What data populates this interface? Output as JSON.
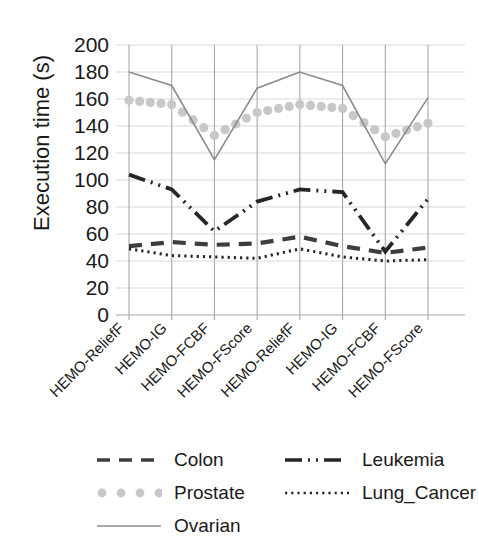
{
  "chart_data": {
    "type": "line",
    "title": "",
    "xlabel": "",
    "ylabel": "Execution time (s)",
    "ylim": [
      0,
      200
    ],
    "ytick_step": 20,
    "yticks": [
      "0",
      "20",
      "40",
      "60",
      "80",
      "100",
      "120",
      "140",
      "160",
      "180",
      "200"
    ],
    "grid": true,
    "legend_position": "bottom",
    "categories": [
      "HEMO-ReliefF",
      "HEMO-IG",
      "HEMO-FCBF",
      "HEMO-FScore",
      "HEMO-ReliefF",
      "HEMO-IG",
      "HEMO-FCBF",
      "HEMO-FScore"
    ],
    "series": [
      {
        "name": "Colon",
        "style": "dashed",
        "color": "#3d3d3d",
        "values": [
          51,
          54,
          52,
          53,
          58,
          51,
          46,
          50
        ]
      },
      {
        "name": "Prostate",
        "style": "dotted-round",
        "color": "#c8c8c8",
        "values": [
          159,
          156,
          133,
          150,
          156,
          153,
          132,
          142
        ]
      },
      {
        "name": "Ovarian",
        "style": "solid",
        "color": "#8c8c8c",
        "values": [
          180,
          170,
          115,
          168,
          180,
          170,
          112,
          161
        ]
      },
      {
        "name": "Leukemia",
        "style": "dash-dot",
        "color": "#262626",
        "values": [
          104,
          93,
          62,
          84,
          93,
          91,
          47,
          86
        ]
      },
      {
        "name": "Lung_Cancer",
        "style": "fine-dotted",
        "color": "#262626",
        "values": [
          49,
          44,
          43,
          42,
          49,
          43,
          40,
          41
        ]
      }
    ]
  },
  "legend": {
    "entries": [
      {
        "label": "Colon",
        "marker": "dashed-line-swatch"
      },
      {
        "label": "Prostate",
        "marker": "dotted-circles-swatch"
      },
      {
        "label": "Ovarian",
        "marker": "solid-line-swatch"
      },
      {
        "label": "Leukemia",
        "marker": "dash-dot-line-swatch"
      },
      {
        "label": "Lung_Cancer",
        "marker": "fine-dotted-line-swatch"
      }
    ]
  },
  "colors": {
    "grid": "#d9d9d9",
    "category_line": "#a8a8a8",
    "text": "#1a1a1a"
  }
}
